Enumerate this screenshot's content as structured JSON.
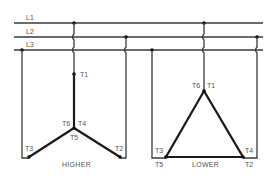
{
  "lines": {
    "l1": "L1",
    "l2": "L2",
    "l3": "L3"
  },
  "higher": {
    "caption": "HIGHER",
    "terminals": {
      "t1": "T1",
      "t2": "T2",
      "t3": "T3",
      "t4": "T4",
      "t5": "T5",
      "t6": "T6"
    }
  },
  "lower": {
    "caption": "LOWER",
    "terminals": {
      "t1": "T1",
      "t2": "T2",
      "t3": "T3",
      "t4": "T4",
      "t5": "T5",
      "t6": "T6"
    }
  },
  "colors": {
    "wire": "#3a3a3a",
    "winding": "#1a1a1a",
    "label": "#555555",
    "background": "#ffffff"
  }
}
